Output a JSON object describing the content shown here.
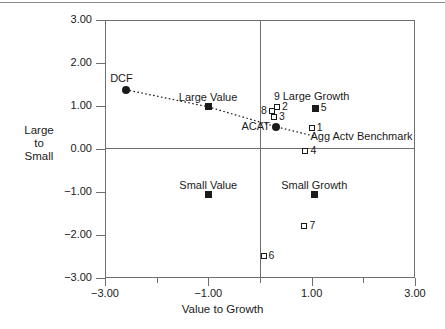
{
  "chart_data": {
    "type": "scatter",
    "title": "",
    "xlabel": "Value to Growth",
    "ylabel": "Large\nto\nSmall",
    "ylabel_lines": [
      "Large",
      "to",
      "Small"
    ],
    "xlim": [
      -3.0,
      3.0
    ],
    "ylim": [
      -3.0,
      3.0
    ],
    "xticks": [
      -3.0,
      -1.0,
      1.0,
      3.0
    ],
    "xtick_labels": [
      "-3.00",
      "-1.00",
      "1.00",
      "3.00"
    ],
    "yticks": [
      -3.0,
      -2.0,
      -1.0,
      0.0,
      1.0,
      2.0,
      3.0
    ],
    "ytick_labels": [
      "-3.00",
      "-2.00",
      "-1.00",
      "0.00",
      "1.00",
      "2.00",
      "3.00"
    ],
    "grid": false,
    "legend": "none",
    "zero_lines": true,
    "points": [
      {
        "id": "dcf",
        "label": "DCF",
        "x": -2.6,
        "y": 1.38,
        "marker": "circle-filled",
        "label_pos": "above-left"
      },
      {
        "id": "large-value",
        "label": "Large Value",
        "x": -1.0,
        "y": 0.98,
        "marker": "square-filled",
        "label_pos": "above"
      },
      {
        "id": "acat",
        "label": "ACAT",
        "x": 0.3,
        "y": 0.52,
        "marker": "circle-filled",
        "label_pos": "left"
      },
      {
        "id": "benchmark",
        "label": "Agg Actv Benchmark",
        "x": 0.88,
        "y": 0.28,
        "marker": "none",
        "label_pos": "right"
      },
      {
        "id": "large-growth",
        "label": "Large Growth",
        "x": 1.05,
        "y": 0.95,
        "marker": "none",
        "label_pos": "title"
      },
      {
        "id": "small-value",
        "label": "Small Value",
        "x": -1.0,
        "y": -1.06,
        "marker": "square-filled",
        "label_pos": "above"
      },
      {
        "id": "small-growth",
        "label": "Small Growth",
        "x": 1.05,
        "y": -1.06,
        "marker": "square-filled",
        "label_pos": "above"
      },
      {
        "id": "p1",
        "label": "1",
        "x": 1.0,
        "y": 0.48,
        "marker": "square-open",
        "label_pos": "right"
      },
      {
        "id": "p2",
        "label": "2",
        "x": 0.33,
        "y": 0.98,
        "marker": "square-open",
        "label_pos": "right"
      },
      {
        "id": "p3",
        "label": "3",
        "x": 0.27,
        "y": 0.75,
        "marker": "square-open",
        "label_pos": "right"
      },
      {
        "id": "p4",
        "label": "4",
        "x": 0.88,
        "y": -0.05,
        "marker": "square-open",
        "label_pos": "right"
      },
      {
        "id": "p5",
        "label": "5",
        "x": 1.08,
        "y": 0.95,
        "marker": "square-filled",
        "label_pos": "right"
      },
      {
        "id": "p6",
        "label": "6",
        "x": 0.07,
        "y": -2.48,
        "marker": "square-open",
        "label_pos": "right"
      },
      {
        "id": "p7",
        "label": "7",
        "x": 0.86,
        "y": -1.8,
        "marker": "square-open",
        "label_pos": "right"
      },
      {
        "id": "p8",
        "label": "8",
        "x": 0.23,
        "y": 0.88,
        "marker": "square-open",
        "label_pos": "left"
      },
      {
        "id": "p9",
        "label": "9",
        "x": 0.33,
        "y": 1.22,
        "marker": "none",
        "label_pos": "center"
      }
    ],
    "trend_line": {
      "style": "dotted",
      "points": [
        {
          "x": -2.6,
          "y": 1.38
        },
        {
          "x": -1.0,
          "y": 0.98
        },
        {
          "x": 0.3,
          "y": 0.52
        },
        {
          "x": 1.05,
          "y": 0.3
        }
      ]
    },
    "colors": {
      "marker": "#1a1a1a",
      "axis": "#6f6f6f",
      "text": "#1a1a1a",
      "background": "#ffffff"
    }
  }
}
